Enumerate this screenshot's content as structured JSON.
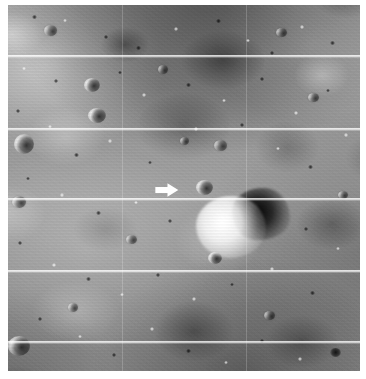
{
  "image": {
    "kind": "lunar-surface-photograph",
    "subject": "Lunar Orbiter style oblique photograph of cratered mare terrain",
    "alt_text": "Grainy black-and-white lunar surface photograph crossed by five horizontal framelet seam lines, with a white arrow pointing right at a small feature left of a bright dome casting a dark shadow",
    "width_px": 366,
    "height_px": 379,
    "plate": {
      "left_px": 8,
      "top_px": 5,
      "width_px": 352,
      "height_px": 366
    },
    "palette": {
      "page_background": "#ffffff",
      "regolith_mid": "#9b9b9b",
      "regolith_light": "#cfcfcf",
      "regolith_dark": "#4a4a4a",
      "shadow_black": "#1a1a1a",
      "highlight_white": "#f5f5f5",
      "framelet_seam": "#ffffff",
      "annotation_arrow": "#ffffff"
    }
  },
  "annotations": {
    "arrow": {
      "name": "target-arrow",
      "shape": "block-arrow",
      "direction": "right",
      "color": "#ffffff",
      "left_px": 155,
      "top_px": 183,
      "width_px": 24,
      "height_px": 14
    }
  },
  "framelet_lines": {
    "orientation": "horizontal",
    "color": "#ffffff",
    "y_px": [
      55,
      128,
      198,
      270,
      341
    ]
  },
  "seams_vertical": {
    "orientation": "vertical",
    "color": "#ffffff",
    "x_px": [
      122,
      246
    ]
  },
  "features": {
    "dome": {
      "name": "bright-dome",
      "left_px": 196,
      "top_px": 196,
      "width_px": 70,
      "height_px": 62
    },
    "dome_shadow": {
      "name": "dome-shadow",
      "left_px": 232,
      "top_px": 188,
      "width_px": 58,
      "height_px": 52
    },
    "craters": [
      {
        "name": "crater-west-rim-bright",
        "style": "halo",
        "left_px": 14,
        "top_px": 134,
        "w": 20,
        "h": 20
      },
      {
        "name": "crater-lower-left-dark",
        "style": "halo",
        "left_px": 8,
        "top_px": 336,
        "w": 22,
        "h": 20
      },
      {
        "name": "crater-upper-left-pair-a",
        "style": "halo",
        "left_px": 84,
        "top_px": 78,
        "w": 16,
        "h": 14
      },
      {
        "name": "crater-upper-left-pair-b",
        "style": "halo",
        "left_px": 88,
        "top_px": 108,
        "w": 18,
        "h": 15
      },
      {
        "name": "crater-right-of-arrow",
        "style": "halo",
        "left_px": 196,
        "top_px": 180,
        "w": 17,
        "h": 15
      },
      {
        "name": "crater-below-dome",
        "style": "halo",
        "left_px": 208,
        "top_px": 252,
        "w": 14,
        "h": 12
      },
      {
        "name": "crater-mid-left-dark",
        "style": "bowl",
        "left_px": 12,
        "top_px": 196,
        "w": 14,
        "h": 12
      },
      {
        "name": "crater-mid-right",
        "style": "bowl",
        "left_px": 214,
        "top_px": 140,
        "w": 13,
        "h": 11
      },
      {
        "name": "crater-right-lower",
        "style": "dark",
        "left_px": 330,
        "top_px": 348,
        "w": 11,
        "h": 9
      },
      {
        "name": "crater-top-right",
        "style": "bowl",
        "left_px": 276,
        "top_px": 28,
        "w": 11,
        "h": 9
      }
    ]
  }
}
